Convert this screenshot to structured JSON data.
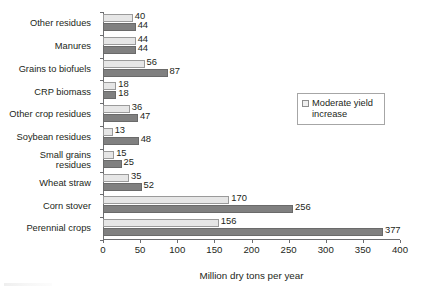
{
  "chart_data": {
    "type": "bar",
    "orientation": "horizontal",
    "title": "",
    "xlabel": "Million dry tons per year",
    "ylabel": "",
    "xlim": [
      0,
      400
    ],
    "xticks": [
      0,
      50,
      100,
      150,
      200,
      250,
      300,
      350,
      400
    ],
    "grid": false,
    "legend_position": "right",
    "categories": [
      "Other residues",
      "Manures",
      "Grains to biofuels",
      "CRP biomass",
      "Other crop residues",
      "Soybean residues",
      "Small grains\nresidues",
      "Wheat straw",
      "Corn stover",
      "Perennial crops"
    ],
    "series": [
      {
        "name": "Moderate yield increase",
        "color": "#e6e6e6",
        "values": [
          40,
          44,
          56,
          18,
          36,
          13,
          15,
          35,
          170,
          156
        ]
      },
      {
        "name": "",
        "color": "#808080",
        "values": [
          44,
          44,
          87,
          18,
          47,
          48,
          25,
          52,
          256,
          377
        ]
      }
    ]
  },
  "legend": {
    "entries": [
      {
        "label": "Moderate yield increase",
        "swatch": "light-square"
      }
    ]
  }
}
